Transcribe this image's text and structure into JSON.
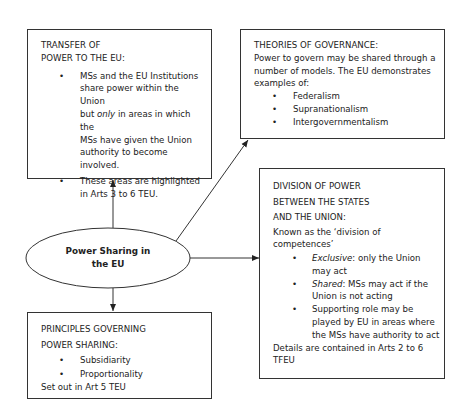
{
  "center": {
    "line1": "Power Sharing in",
    "line2": "the EU"
  },
  "transfer": {
    "title_line1": "TRANSFER OF",
    "title_line2": "POWER TO THE EU:",
    "bullets": [
      {
        "lines": [
          "MSs and the EU Institutions",
          "share power within the Union",
          "but only in areas in which the",
          "MSs have given the Union",
          "authority to become",
          "involved."
        ]
      },
      {
        "lines": [
          "These areas are highlighted",
          "in Arts 3 to 6 TEU."
        ]
      }
    ]
  },
  "theories": {
    "title": "THEORIES OF GOVERNANCE:",
    "intro_lines": [
      "Power to govern may be shared through a",
      "number of models. The EU demonstrates",
      "examples of:"
    ],
    "bullets": [
      "Federalism",
      "Supranationalism",
      "Intergovernmentalism"
    ]
  },
  "division": {
    "title_lines": [
      "DIVISION OF POWER",
      "BETWEEN THE STATES",
      "AND THE UNION:"
    ],
    "intro_lines": [
      "Known as the ‘division of",
      "competences’"
    ],
    "bullets": [
      {
        "em": "Exclusive",
        "rest": ": only the Union",
        "line2": "may act"
      },
      {
        "em": "Shared",
        "rest": ": MSs may act if the",
        "line2": "Union is not acting"
      },
      {
        "em": "",
        "rest": "Supporting role may be",
        "line2": "played by EU in areas where",
        "line3": "the MSs have authority to act"
      }
    ],
    "footer_lines": [
      "Details are contained in Arts 2 to 6",
      "TFEU"
    ]
  },
  "principles": {
    "title_lines": [
      "PRINCIPLES GOVERNING",
      "POWER SHARING:"
    ],
    "bullets": [
      "Subsidiarity",
      "Proportionality"
    ],
    "footer": "Set out in Art 5 TEU"
  },
  "bullet_char": "•"
}
